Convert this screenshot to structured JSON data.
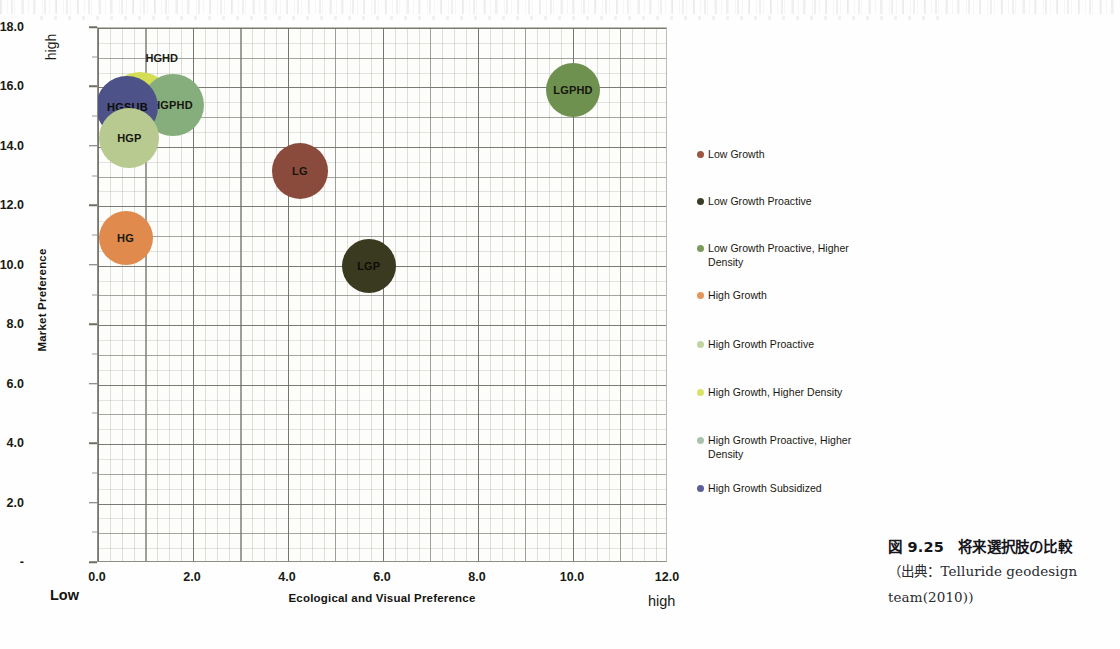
{
  "chart_data": {
    "type": "scatter",
    "title": "",
    "xlabel": "Ecological and Visual Preference",
    "ylabel": "Market Preference",
    "xlim": [
      0.0,
      12.0
    ],
    "ylim": [
      0.0,
      18.0
    ],
    "x_ticks": [
      "0.0",
      "2.0",
      "4.0",
      "6.0",
      "8.0",
      "10.0",
      "12.0"
    ],
    "y_ticks": [
      "-",
      "2.0",
      "4.0",
      "6.0",
      "8.0",
      "10.0",
      "12.0",
      "14.0",
      "16.0",
      "18.0"
    ],
    "x_axis_low_label": "Low",
    "x_axis_high_label": "high",
    "y_axis_high_label": "high",
    "grid": true,
    "legend_position": "right",
    "points": [
      {
        "code": "LG",
        "name": "Low Growth",
        "x": 4.25,
        "y": 13.2,
        "size": 56,
        "color": "#8a4b3c",
        "label_inside": true
      },
      {
        "code": "LGP",
        "name": "Low Growth Proactive",
        "x": 5.7,
        "y": 10.0,
        "size": 54,
        "color": "#3a3a21",
        "label_inside": true
      },
      {
        "code": "LGPHD",
        "name": "Low Growth Proactive, Higher Density",
        "x": 10.0,
        "y": 15.9,
        "size": 54,
        "color": "#6f9150",
        "label_inside": true
      },
      {
        "code": "HG",
        "name": "High Growth",
        "x": 0.58,
        "y": 10.95,
        "size": 54,
        "color": "#e08a4d",
        "label_inside": true
      },
      {
        "code": "HGP",
        "name": "High Growth Proactive",
        "x": 0.66,
        "y": 14.3,
        "size": 60,
        "color": "#b8ca8f",
        "label_inside": true
      },
      {
        "code": "HGHD",
        "name": "High Growth, Higher Density",
        "x": 0.88,
        "y": 15.4,
        "size": 66,
        "color": "#d3dd55",
        "label_inside": false
      },
      {
        "code": "HGPHD",
        "name": "High Growth Proactive, Higher Density",
        "x": 1.57,
        "y": 15.4,
        "size": 62,
        "color": "#86ae7c",
        "label_inside": true
      },
      {
        "code": "HGSUB",
        "name": "High Growth Subsidized",
        "x": 0.62,
        "y": 15.35,
        "size": 62,
        "color": "#4d5289",
        "label_inside": true
      }
    ],
    "legend": [
      {
        "label": "Low Growth",
        "color": "#9c5540"
      },
      {
        "label": "Low Growth Proactive",
        "color": "#3c3d26"
      },
      {
        "label": "Low Growth Proactive, Higher Density",
        "color": "#7a9b5c"
      },
      {
        "label": "High Growth",
        "color": "#e5945a"
      },
      {
        "label": "High Growth Proactive",
        "color": "#c2d3a2"
      },
      {
        "label": "High Growth, Higher Density",
        "color": "#d9e266"
      },
      {
        "label": "High Growth Proactive, Higher Density",
        "color": "#a9c2ab"
      },
      {
        "label": "High Growth Subsidized",
        "color": "#5a5f99"
      }
    ]
  },
  "caption": {
    "title": "図 9.25　将来選択肢の比較",
    "source_line1": "（出典：Telluride geodesign",
    "source_line2": "team(2010))"
  }
}
